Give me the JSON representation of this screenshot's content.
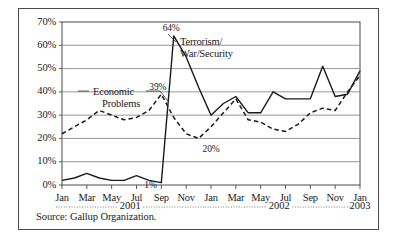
{
  "figure": {
    "source_note": "Source: Gallup Organization."
  },
  "chart_data": {
    "type": "line",
    "title": "",
    "subtitle": "",
    "xlabel": "",
    "ylabel": "",
    "ylim": [
      0,
      70
    ],
    "ytick_labels": [
      "0%",
      "10%",
      "20%",
      "30%",
      "40%",
      "50%",
      "60%",
      "70%"
    ],
    "ytick_values": [
      0,
      10,
      20,
      30,
      40,
      50,
      60,
      70
    ],
    "grid": true,
    "legend_position": "inline-annotation",
    "x": [
      "Jan 2001",
      "Feb 2001",
      "Mar 2001",
      "Apr 2001",
      "May 2001",
      "Jun 2001",
      "Jul 2001",
      "Aug 2001",
      "Sep 2001",
      "Oct 2001",
      "Nov 2001",
      "Dec 2001",
      "Jan 2002",
      "Feb 2002",
      "Mar 2002",
      "Apr 2002",
      "May 2002",
      "Jun 2002",
      "Jul 2002",
      "Aug 2002",
      "Sep 2002",
      "Oct 2002",
      "Nov 2002",
      "Dec 2002",
      "Jan 2003"
    ],
    "xtick_labels": [
      "Jan",
      "Mar",
      "May",
      "Jul",
      "Sep",
      "Nov",
      "Jan",
      "Mar",
      "May",
      "Jul",
      "Sep",
      "Nov",
      "Jan"
    ],
    "xtick_indices": [
      0,
      2,
      4,
      6,
      8,
      10,
      12,
      14,
      16,
      18,
      20,
      22,
      24
    ],
    "year_groups": [
      {
        "label": "2001",
        "start_index": 0,
        "end_index": 11
      },
      {
        "label": "2002",
        "start_index": 12,
        "end_index": 23
      },
      {
        "label": "2003",
        "start_index": 24,
        "end_index": 24
      }
    ],
    "series": [
      {
        "name": "Terrorism/War/Security",
        "style": "solid",
        "color": "#1a1a1a",
        "values": [
          2,
          3,
          5,
          3,
          2,
          2,
          4,
          2,
          1,
          64,
          55,
          42,
          30,
          35,
          38,
          31,
          31,
          40,
          37,
          37,
          37,
          51,
          38,
          39,
          49
        ]
      },
      {
        "name": "Economic Problems",
        "style": "dashed",
        "color": "#1a1a1a",
        "values": [
          22,
          25,
          28,
          32,
          30,
          28,
          29,
          32,
          39,
          29,
          22,
          20,
          25,
          31,
          37,
          28,
          27,
          24,
          23,
          26,
          31,
          33,
          32,
          40,
          47
        ]
      }
    ],
    "annotations": [
      {
        "text": "64%",
        "series": "Terrorism/War/Security",
        "index": 9,
        "value": 64
      },
      {
        "text": "39%",
        "series": "Economic Problems",
        "index": 8,
        "value": 39
      },
      {
        "text": "20%",
        "series": "Economic Problems",
        "index": 11,
        "value": 20
      },
      {
        "text": "1%",
        "series": "Terrorism/War/Security",
        "index": 8,
        "value": 1
      }
    ],
    "series_labels": [
      {
        "line1": "Terrorism/",
        "line2": "War/Security"
      },
      {
        "line1": "Economic",
        "line2": "Problems"
      }
    ]
  }
}
